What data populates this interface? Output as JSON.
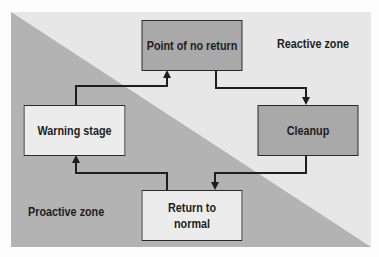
{
  "diagram": {
    "zones": {
      "reactive": "Reactive zone",
      "proactive": "Proactive zone"
    },
    "nodes": [
      {
        "id": "point-of-no-return",
        "label": "Point of no return",
        "shade": "dark"
      },
      {
        "id": "cleanup",
        "label": "Cleanup",
        "shade": "dark"
      },
      {
        "id": "return-to-normal",
        "label": "Return to normal",
        "shade": "light"
      },
      {
        "id": "warning-stage",
        "label": "Warning stage",
        "shade": "light"
      }
    ],
    "edges": [
      {
        "from": "warning-stage",
        "to": "point-of-no-return"
      },
      {
        "from": "point-of-no-return",
        "to": "cleanup"
      },
      {
        "from": "cleanup",
        "to": "return-to-normal"
      },
      {
        "from": "return-to-normal",
        "to": "warning-stage"
      }
    ],
    "colors": {
      "reactive_bg": "#e7e7e7",
      "proactive_bg": "#b3b3b3",
      "dark_box": "#a9a9a9",
      "light_box": "#ececec",
      "line": "#1e1e1e"
    }
  }
}
